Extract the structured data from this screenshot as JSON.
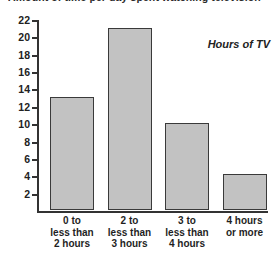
{
  "title_clipped": "Amount of time per day spent watching television",
  "annotation": "Hours of TV",
  "chart_data": {
    "type": "bar",
    "title": "Amount of time per day spent watching television",
    "xlabel": "",
    "ylabel": "",
    "ylim": [
      0,
      22
    ],
    "grid": false,
    "legend_position": "none",
    "annotations": [
      "Hours of TV"
    ],
    "categories": [
      "0 to less than 2 hours",
      "2 to less than 3 hours",
      "3 to less than 4 hours",
      "4 hours or more"
    ],
    "category_lines": [
      [
        "0 to",
        "less than",
        "2 hours"
      ],
      [
        "2 to",
        "less than",
        "3 hours"
      ],
      [
        "3 to",
        "less than",
        "4 hours"
      ],
      [
        "4 hours",
        "or more"
      ]
    ],
    "values": [
      13,
      21,
      10,
      4.2
    ],
    "ytick_labels": [
      "2",
      "4",
      "6",
      "8",
      "10",
      "12",
      "14",
      "16",
      "18",
      "20",
      "22"
    ],
    "ytick_values": [
      2,
      4,
      6,
      8,
      10,
      12,
      14,
      16,
      18,
      20,
      22
    ],
    "colors": {
      "bar_fill": "#c2c2c2",
      "bar_border": "#3a3a3a",
      "axis": "#333333",
      "text": "#1f1f1f",
      "background": "#ffffff"
    }
  }
}
